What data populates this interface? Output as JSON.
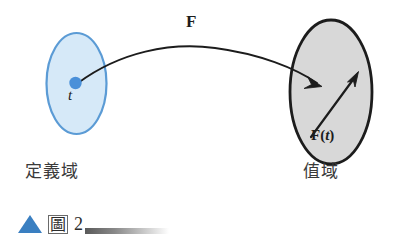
{
  "figure": {
    "background_color": "#ffffff",
    "domain_set": {
      "name": "domain-ellipse",
      "fill_color": "#d6e9f8",
      "stroke_color": "#5b9bd5",
      "label": "定義域",
      "point_label": "t",
      "point_color": "#4a90d9"
    },
    "range_set": {
      "name": "range-ellipse",
      "fill_color": "#d8d8d8",
      "stroke_color": "#1c1c1c",
      "label": "值域"
    },
    "mapping_arrow": {
      "label": "F",
      "stroke_color": "#1c1c1c"
    },
    "vector_arrow": {
      "label_bold": "F",
      "label_paren_open": "(",
      "label_var": "t",
      "label_paren_close": ")",
      "stroke_color": "#1c1c1c"
    }
  },
  "caption": {
    "marker_icon": "triangle-up-icon",
    "marker_color": "#3a7fc1",
    "figure_word": "圖",
    "figure_number": "2",
    "rule_gradient_from": "#5a5a5a",
    "rule_gradient_to": "#ffffff"
  }
}
